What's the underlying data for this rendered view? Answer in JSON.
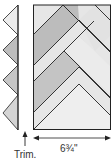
{
  "diagram": {
    "type": "quilt-herringbone-panel",
    "labels": {
      "trim": "Trim.",
      "width": "6¾\""
    },
    "colors": {
      "outline": "#222222",
      "light_fill": "#e8e8e8",
      "mid_fill": "#cfcfcf",
      "dark_fill": "#b8b8b8",
      "background": "#ffffff"
    },
    "parts": {
      "trim_strip": "left triangle strip to be trimmed",
      "panel": "herringbone pieced panel",
      "trim_arrow": "upward arrow pointing to trim line",
      "width_arrow": "double-headed dimension arrow"
    }
  }
}
